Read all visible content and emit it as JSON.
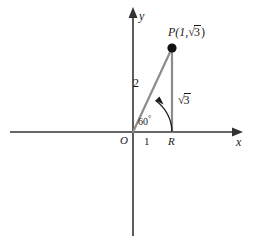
{
  "figure": {
    "colors": {
      "axis": "#333333",
      "triangle": "#8c8c8c",
      "point": "#111111",
      "text": "#1a1a1a",
      "background": "#ffffff"
    },
    "axes": {
      "x_label": "x",
      "y_label": "y",
      "origin_label": "O"
    },
    "labels": {
      "point_p_prefix": "P(1,",
      "point_p_radicand": "3",
      "point_p_suffix": ")",
      "radical_sign": "√",
      "hypotenuse": "2",
      "opposite_radicand": "3",
      "angle": "60",
      "angle_degree_symbol": "°",
      "tick_one": "1",
      "foot_point": "R"
    },
    "geometry": {
      "origin_px": [
        133,
        132
      ],
      "point_p_px": [
        172,
        48
      ],
      "point_r_px": [
        172,
        132
      ],
      "hypotenuse_length": "2",
      "opposite_length": "√3",
      "adjacent_length": "1",
      "angle_degrees": 60
    }
  }
}
